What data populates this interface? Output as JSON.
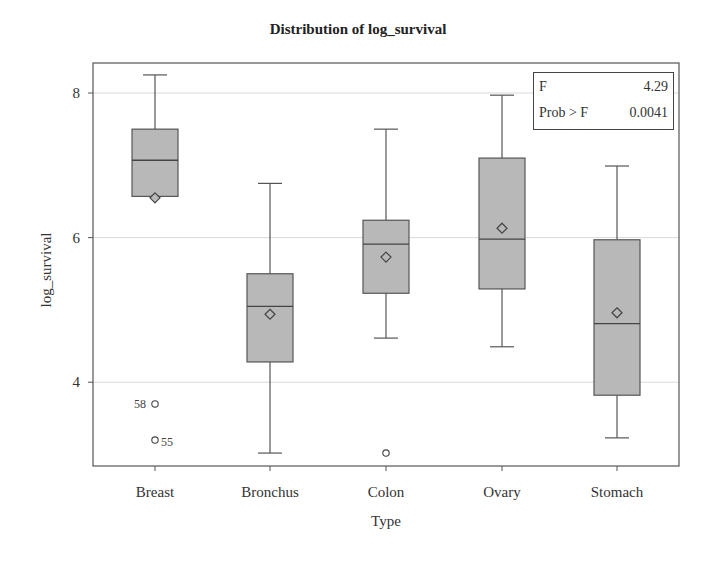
{
  "chart_data": {
    "type": "box",
    "title": "Distribution of log_survival",
    "xlabel": "Type",
    "ylabel": "log_survival",
    "ylim": [
      2.85,
      8.4
    ],
    "yticks": [
      4,
      6,
      8
    ],
    "grid": "horizontal at y ticks",
    "categories": [
      "Breast",
      "Bronchus",
      "Colon",
      "Ovary",
      "Stomach"
    ],
    "boxes": [
      {
        "category": "Breast",
        "whisker_low": 6.57,
        "q1": 6.57,
        "median": 7.07,
        "q3": 7.5,
        "whisker_high": 8.25,
        "mean": 6.55,
        "outliers": [
          {
            "value": 3.7,
            "label": "58"
          },
          {
            "value": 3.2,
            "label": "55"
          }
        ]
      },
      {
        "category": "Bronchus",
        "whisker_low": 3.02,
        "q1": 4.28,
        "median": 5.05,
        "q3": 5.5,
        "whisker_high": 6.75,
        "mean": 4.94,
        "outliers": []
      },
      {
        "category": "Colon",
        "whisker_low": 4.61,
        "q1": 5.23,
        "median": 5.91,
        "q3": 6.24,
        "whisker_high": 7.5,
        "mean": 5.73,
        "outliers": [
          {
            "value": 3.02,
            "label": ""
          }
        ]
      },
      {
        "category": "Ovary",
        "whisker_low": 4.49,
        "q1": 5.29,
        "median": 5.98,
        "q3": 7.1,
        "whisker_high": 7.97,
        "mean": 6.13,
        "outliers": []
      },
      {
        "category": "Stomach",
        "whisker_low": 3.23,
        "q1": 3.82,
        "median": 4.81,
        "q3": 5.97,
        "whisker_high": 6.99,
        "mean": 4.96,
        "outliers": []
      }
    ],
    "inset": {
      "rows": [
        {
          "label": "F",
          "value": "4.29"
        },
        {
          "label": "Prob > F",
          "value": "0.0041"
        }
      ]
    },
    "colors": {
      "box_fill": "#b8b8b8",
      "box_stroke": "#555555",
      "grid": "#d9d9d9",
      "frame": "#555555"
    }
  }
}
